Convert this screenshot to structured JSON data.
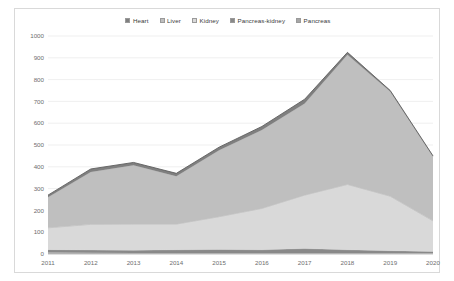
{
  "chart_data": {
    "type": "area",
    "stacked": true,
    "title": "",
    "xlabel": "",
    "ylabel": "",
    "categories": [
      "2011",
      "2012",
      "2013",
      "2014",
      "2015",
      "2016",
      "2017",
      "2018",
      "2019",
      "2020"
    ],
    "x": [
      2011,
      2012,
      2013,
      2014,
      2015,
      2016,
      2017,
      2018,
      2019,
      2020
    ],
    "ylim": [
      0,
      1000
    ],
    "ytick_labels": [
      "0",
      "100",
      "200",
      "300",
      "400",
      "500",
      "600",
      "700",
      "800",
      "900",
      "1000"
    ],
    "ytick_values": [
      0,
      100,
      200,
      300,
      400,
      500,
      600,
      700,
      800,
      900,
      1000
    ],
    "ytick_step": 100,
    "grid": true,
    "legend_position": "top-center",
    "legend": [
      "Heart",
      "Liver",
      "Kidney",
      "Pancreas-kidney",
      "Pancreas"
    ],
    "series": [
      {
        "name": "Pancreas",
        "color": "#a6a6a6",
        "values": [
          8,
          6,
          5,
          5,
          5,
          5,
          5,
          5,
          5,
          4
        ]
      },
      {
        "name": "Pancreas-kidney",
        "color": "#898989",
        "values": [
          12,
          12,
          12,
          14,
          16,
          14,
          20,
          14,
          10,
          8
        ]
      },
      {
        "name": "Kidney",
        "color": "#d9d9d9",
        "values": [
          100,
          118,
          120,
          118,
          150,
          190,
          245,
          300,
          250,
          140
        ]
      },
      {
        "name": "Liver",
        "color": "#bfbfbf",
        "values": [
          140,
          240,
          270,
          220,
          305,
          360,
          420,
          595,
          480,
          295
        ]
      },
      {
        "name": "Heart",
        "color": "#7f7f7f",
        "values": [
          10,
          14,
          13,
          13,
          14,
          16,
          20,
          11,
          5,
          3
        ]
      }
    ],
    "totals": [
      270,
      390,
      420,
      370,
      490,
      585,
      710,
      925,
      750,
      450
    ],
    "stack_order": [
      "Pancreas",
      "Pancreas-kidney",
      "Kidney",
      "Liver",
      "Heart"
    ]
  },
  "style": {
    "plot_background": "#ffffff",
    "border_color": "#d9d9d9",
    "gridline_color": "#e4e4e4",
    "tick_text_color": "#6e6e6e",
    "legend_text_color": "#3a3a3a"
  }
}
